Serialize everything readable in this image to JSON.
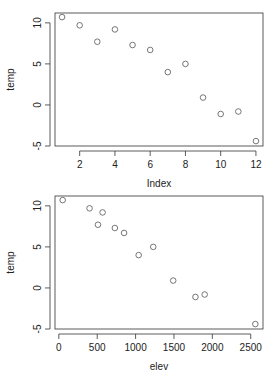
{
  "chart_data": [
    {
      "type": "scatter",
      "title": "",
      "xlabel": "Index",
      "ylabel": "temp",
      "xlim": [
        0.6,
        12.4
      ],
      "ylim": [
        -5,
        11.2
      ],
      "xticks": [
        2,
        4,
        6,
        8,
        10,
        12
      ],
      "yticks": [
        -5,
        0,
        5,
        10
      ],
      "grid": false,
      "legend": null,
      "x": [
        1,
        2,
        3,
        4,
        5,
        6,
        7,
        8,
        9,
        10,
        11,
        12
      ],
      "y": [
        10.7,
        9.7,
        7.7,
        9.2,
        7.3,
        6.7,
        4.0,
        5.0,
        0.9,
        -1.1,
        -0.8,
        -4.4
      ]
    },
    {
      "type": "scatter",
      "title": "",
      "xlabel": "elev",
      "ylabel": "temp",
      "xlim": [
        -50,
        2660
      ],
      "ylim": [
        -5,
        11.2
      ],
      "xticks": [
        0,
        500,
        1000,
        1500,
        2000,
        2500
      ],
      "yticks": [
        -5,
        0,
        5,
        10
      ],
      "grid": false,
      "legend": null,
      "x": [
        50,
        400,
        510,
        570,
        730,
        850,
        1040,
        1230,
        1490,
        1780,
        1900,
        2560
      ],
      "y": [
        10.7,
        9.7,
        7.7,
        9.2,
        7.3,
        6.7,
        4.0,
        5.0,
        0.9,
        -1.1,
        -0.8,
        -4.4
      ]
    }
  ],
  "plots": [
    {
      "xlabel": "Index",
      "ylabel": "temp"
    },
    {
      "xlabel": "elev",
      "ylabel": "temp"
    }
  ],
  "colors": {
    "point": "#555555",
    "axis": "#333333"
  }
}
